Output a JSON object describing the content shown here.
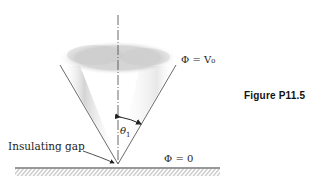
{
  "figure": {
    "caption": "Figure P11.5",
    "labels": {
      "top_potential": "Φ = V₀",
      "ground_potential": "Φ = 0",
      "angle_symbol": "θ",
      "angle_subscript": "1",
      "gap_label": "Insulating gap"
    },
    "colors": {
      "line": "#333333",
      "shading": "#9a9a9a",
      "background": "#ffffff"
    }
  }
}
